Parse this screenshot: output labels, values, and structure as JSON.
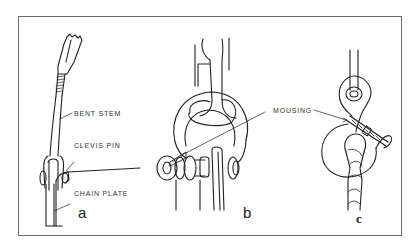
{
  "figure": {
    "panels": [
      {
        "id": "a",
        "letter": "a",
        "callouts": [
          "BENT STEM",
          "CLEVIS PIN",
          "CHAIN PLATE"
        ]
      },
      {
        "id": "b",
        "letter": "b",
        "callouts": [
          "MOUSING"
        ]
      },
      {
        "id": "c",
        "letter": "c",
        "callouts": []
      }
    ],
    "shared_callout": "MOUSING",
    "colors": {
      "line": "#222222",
      "frame": "#6b6b6b",
      "background": "#ffffff"
    }
  }
}
